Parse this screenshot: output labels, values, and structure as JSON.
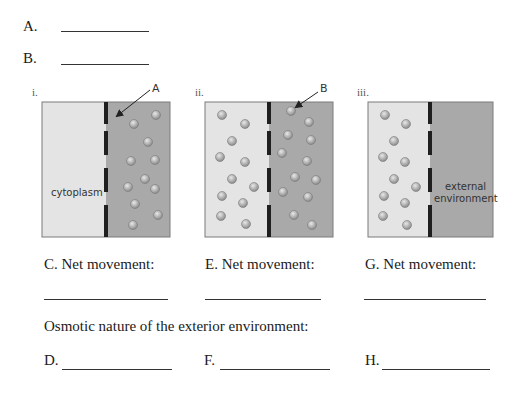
{
  "answer_blanks_top": [
    {
      "label": "A."
    },
    {
      "label": "B."
    }
  ],
  "diagrams": [
    {
      "roman": "i.",
      "pointer_label": "A",
      "inside_label": "cytoplasm",
      "outside_label": "",
      "left_color": "#e4e4e4",
      "right_color": "#a9a9a9",
      "left_particles": [],
      "right_particles": [
        [
          156,
          115
        ],
        [
          134,
          124
        ],
        [
          148,
          142
        ],
        [
          131,
          161
        ],
        [
          155,
          160
        ],
        [
          145,
          179
        ],
        [
          128,
          187
        ],
        [
          155,
          189
        ],
        [
          135,
          204
        ],
        [
          158,
          215
        ],
        [
          133,
          225
        ]
      ]
    },
    {
      "roman": "ii.",
      "pointer_label": "B",
      "inside_label": "",
      "outside_label": "",
      "left_color": "#e4e4e4",
      "right_color": "#a9a9a9",
      "left_particles": [
        [
          222,
          115
        ],
        [
          245,
          124
        ],
        [
          232,
          141
        ],
        [
          220,
          157
        ],
        [
          245,
          162
        ],
        [
          232,
          179
        ],
        [
          254,
          187
        ],
        [
          222,
          196
        ],
        [
          243,
          203
        ],
        [
          221,
          216
        ],
        [
          246,
          224
        ]
      ],
      "right_particles": [
        [
          291,
          111
        ],
        [
          309,
          122
        ],
        [
          288,
          135
        ],
        [
          311,
          140
        ],
        [
          282,
          153
        ],
        [
          307,
          161
        ],
        [
          295,
          177
        ],
        [
          316,
          180
        ],
        [
          283,
          192
        ],
        [
          308,
          197
        ],
        [
          294,
          215
        ],
        [
          312,
          225
        ]
      ]
    },
    {
      "roman": "iii.",
      "pointer_label": "",
      "inside_label": "",
      "outside_label_line1": "external",
      "outside_label_line2": "environment",
      "left_color": "#e4e4e4",
      "right_color": "#a9a9a9",
      "left_particles": [
        [
          385,
          115
        ],
        [
          406,
          124
        ],
        [
          394,
          141
        ],
        [
          383,
          157
        ],
        [
          405,
          162
        ],
        [
          394,
          179
        ],
        [
          416,
          187
        ],
        [
          384,
          196
        ],
        [
          405,
          203
        ],
        [
          383,
          216
        ],
        [
          407,
          225
        ]
      ],
      "right_particles": []
    }
  ],
  "net_movement": [
    {
      "label": "C. Net movement:"
    },
    {
      "label": "E. Net movement:"
    },
    {
      "label": "G. Net movement:"
    }
  ],
  "osmotic_heading": "Osmotic nature of the exterior environment:",
  "osmotic_blanks": [
    {
      "label": "D."
    },
    {
      "label": "F."
    },
    {
      "label": "H."
    }
  ]
}
